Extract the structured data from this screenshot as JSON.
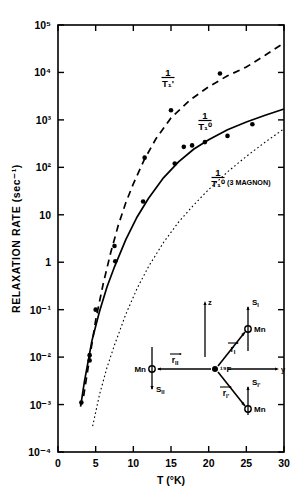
{
  "figure": {
    "background": "#ffffff",
    "ink": "#000000"
  },
  "axes": {
    "ylabel": "RELAXATION RATE (sec⁻¹)",
    "xlabel": "T (°K)",
    "x_ticks": [
      "0",
      "5",
      "10",
      "15",
      "20",
      "25",
      "30"
    ],
    "y_ticks": [
      "10⁵",
      "10⁴",
      "10³",
      "10²",
      "10",
      "1",
      "10⁻¹",
      "10⁻²",
      "10⁻³",
      "10⁻⁴"
    ]
  },
  "curve_labels": {
    "dashed": {
      "num": "1",
      "den": "T₁'"
    },
    "solid": {
      "num": "1",
      "den": "T₁⁰"
    },
    "dotted": {
      "num": "1",
      "den": "T₁⁰",
      "suffix": "(3 MAGNON)"
    }
  },
  "inset": {
    "axis_z": "z",
    "axis_y": "y",
    "center_atom": "¹⁹F",
    "mn_left": "Mn",
    "mn_upper": "Mn",
    "mn_lower": "Mn",
    "spin_I": "S",
    "spin_I_sub": "I",
    "spin_II": "S",
    "spin_II_sub": "II",
    "spin_Ip": "S",
    "spin_Ip_sub": "I'",
    "vec_rII": "r",
    "vec_rII_sub": "II",
    "vec_rI": "r",
    "vec_rI_sub": "I",
    "vec_rIp": "r",
    "vec_rIp_sub": "I'"
  },
  "chart_data": {
    "type": "line",
    "title": "",
    "xlabel": "T (°K)",
    "ylabel": "RELAXATION RATE (sec⁻¹)",
    "xlim": [
      0,
      30
    ],
    "ylim": [
      0.0001,
      100000
    ],
    "yscale": "log",
    "xscale": "linear",
    "grid": false,
    "legend": "none (inline curve annotations)",
    "series": [
      {
        "name": "1/T1'",
        "style": "dashed",
        "annotation": "1/T₁'",
        "line_x": [
          3.4,
          4.0,
          5.0,
          6.0,
          7.0,
          8.0,
          9.0,
          10.0,
          11.5,
          13.0,
          15.0,
          17.5,
          20.0,
          22.5,
          25.0,
          27.5,
          30.0
        ],
        "line_y": [
          0.0015,
          0.006,
          0.06,
          0.35,
          1.6,
          6.0,
          18.0,
          45.0,
          150.0,
          400.0,
          1100.0,
          2600.0,
          5000.0,
          8500.0,
          13000.0,
          23000.0,
          42000.0
        ],
        "points_x": [
          4.2,
          5.0,
          7.5,
          11.5,
          15.0,
          21.5
        ],
        "points_y": [
          0.011,
          0.1,
          2.2,
          160.0,
          1600.0,
          9500.0
        ]
      },
      {
        "name": "1/T1_0",
        "style": "solid",
        "annotation": "1/T₁⁰",
        "line_x": [
          3.0,
          3.5,
          4.5,
          5.5,
          6.5,
          7.5,
          9.0,
          10.5,
          12.0,
          14.0,
          16.0,
          18.0,
          20.0,
          22.5,
          25.0,
          27.5,
          30.0
        ],
        "line_y": [
          0.0009,
          0.003,
          0.022,
          0.09,
          0.3,
          0.8,
          3.0,
          9.0,
          22.0,
          60.0,
          130.0,
          240.0,
          380.0,
          620.0,
          900.0,
          1250.0,
          1700.0
        ],
        "points_x": [
          3.1,
          4.2,
          7.6,
          11.3,
          15.5,
          16.7,
          17.8,
          19.5,
          22.5,
          25.8
        ],
        "points_y": [
          0.0011,
          0.0085,
          1.05,
          19.0,
          120.0,
          270.0,
          290.0,
          340.0,
          460.0,
          810.0,
          1200.0
        ]
      },
      {
        "name": "1/T1_0 (3 MAGNON)",
        "style": "dotted",
        "annotation": "1/T₁⁰ (3 MAGNON)",
        "line_x": [
          4.6,
          5.5,
          6.5,
          7.5,
          9.0,
          10.5,
          12.0,
          14.0,
          16.0,
          18.0,
          20.0,
          22.5,
          25.0,
          27.5,
          30.0
        ],
        "line_y": [
          0.00035,
          0.0016,
          0.006,
          0.018,
          0.08,
          0.28,
          0.8,
          2.6,
          7.0,
          16.0,
          34.0,
          80.0,
          170.0,
          340.0,
          650.0
        ],
        "points_x": [],
        "points_y": []
      }
    ]
  }
}
